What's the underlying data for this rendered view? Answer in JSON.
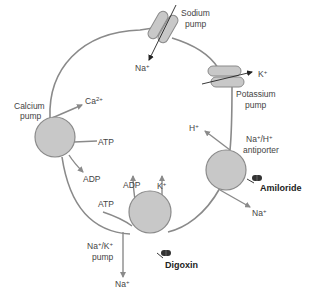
{
  "diagram": {
    "colors": {
      "membrane": "#8a8a8a",
      "pump_fill": "#c8c8c8",
      "pump_stroke": "#8a8a8a",
      "arrow_gray": "#8a8a8a",
      "arrow_black": "#222222",
      "text": "#444444",
      "drug_text": "#222222",
      "pill_fill": "#333333"
    },
    "pumps": {
      "sodium": {
        "label_line1": "Sodium",
        "label_line2": "pump",
        "ion": "Na",
        "ion_sup": "+"
      },
      "potassium": {
        "label_line1": "Potassium",
        "label_line2": "pump",
        "ion": "K",
        "ion_sup": "+"
      },
      "calcium": {
        "label_line1": "Calcium",
        "label_line2": "pump",
        "ion": "Ca",
        "ion_sup": "2+",
        "atp": "ATP",
        "adp": "ADP"
      },
      "antiporter": {
        "label_line1_a": "Na",
        "label_line1_b": "/H",
        "sup": "+",
        "label_line2": "antiporter",
        "ion_out": "H",
        "ion_out_sup": "+",
        "ion_in": "Na",
        "ion_in_sup": "+"
      },
      "nak": {
        "label_line1_a": "Na",
        "label_line1_b": "/K",
        "sup": "+",
        "label_line2": "pump",
        "atp": "ATP",
        "adp": "ADP",
        "k": "K",
        "k_sup": "+",
        "na": "Na",
        "na_sup": "+"
      }
    },
    "drugs": {
      "amiloride": "Amiloride",
      "digoxin": "Digoxin"
    }
  }
}
